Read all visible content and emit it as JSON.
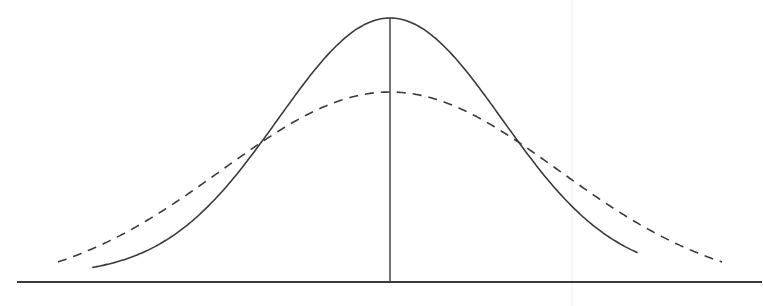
{
  "diagram": {
    "type": "normal-distribution-comparison",
    "background": "#ffffff",
    "ink_color": "#3a3a3a",
    "baseline": {
      "y": 282,
      "x_start": 17,
      "x_end": 762,
      "stroke_width": 2
    },
    "center_line": {
      "x": 390,
      "y_top": 18,
      "y_bottom": 282,
      "stroke_width": 1.4
    },
    "faint_guide_line": {
      "x": 572,
      "y_top": 0,
      "y_bottom": 306,
      "color": "#ececec"
    },
    "curves": [
      {
        "name": "narrow-distribution",
        "style": "solid",
        "mean_x": 390,
        "peak_y": 18,
        "floor_y": 275,
        "sigma_px": 112,
        "x_start": 93,
        "x_end": 637,
        "stroke_width": 1.6
      },
      {
        "name": "wide-distribution",
        "style": "dashed",
        "mean_x": 390,
        "peak_y": 92,
        "floor_y": 290,
        "sigma_px": 168,
        "x_start": 58,
        "x_end": 722,
        "stroke_width": 1.6,
        "dash": "9 7"
      }
    ]
  }
}
